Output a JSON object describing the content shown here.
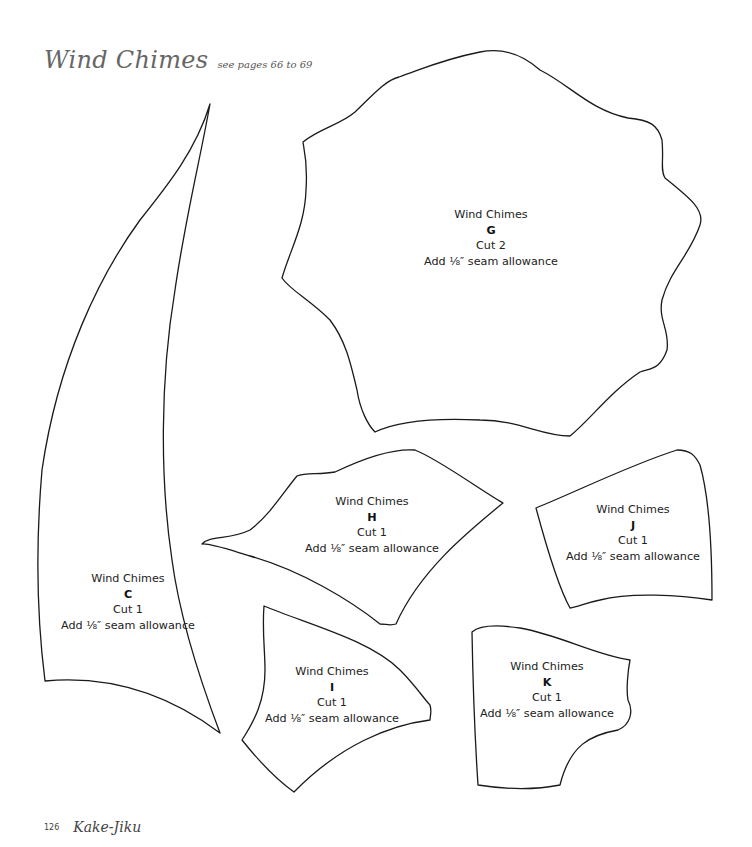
{
  "header": {
    "title": "Wind Chimes",
    "subtitle": "see pages 66 to 69"
  },
  "pieces": [
    {
      "name": "Wind Chimes",
      "letter": "C",
      "cut": "Cut 1",
      "seam": "Add ⅛″ seam allowance"
    },
    {
      "name": "Wind Chimes",
      "letter": "G",
      "cut": "Cut 2",
      "seam": "Add ⅛″ seam allowance"
    },
    {
      "name": "Wind Chimes",
      "letter": "H",
      "cut": "Cut 1",
      "seam": "Add ⅛″ seam allowance"
    },
    {
      "name": "Wind Chimes",
      "letter": "J",
      "cut": "Cut 1",
      "seam": "Add ⅛″ seam allowance"
    },
    {
      "name": "Wind Chimes",
      "letter": "I",
      "cut": "Cut 1",
      "seam": "Add ⅛″ seam allowance"
    },
    {
      "name": "Wind Chimes",
      "letter": "K",
      "cut": "Cut 1",
      "seam": "Add ⅛″ seam allowance"
    }
  ],
  "footer": {
    "page_number": "126",
    "book_title": "Kake-Jiku"
  }
}
